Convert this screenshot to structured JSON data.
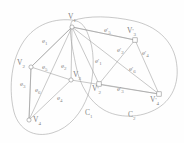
{
  "figure": {
    "type": "graph-diagram",
    "stroke_color": "#9b9b9b",
    "text_color": "#8a8a8a",
    "background": "#fefefe"
  },
  "clusters": [
    {
      "id": "C1",
      "label": "C",
      "sub": "1",
      "x": 86,
      "y": 113
    },
    {
      "id": "C2",
      "label": "C",
      "sub": "2",
      "x": 130,
      "y": 115
    }
  ],
  "nodes": [
    {
      "id": "V1",
      "label": "V",
      "sub": "1",
      "prime": "",
      "shape": "circle",
      "cx": 72,
      "cy": 27,
      "lx": 68,
      "ly": 14
    },
    {
      "id": "V2",
      "label": "V",
      "sub": "2",
      "prime": "",
      "shape": "circle",
      "cx": 31,
      "cy": 67,
      "lx": 18,
      "ly": 59
    },
    {
      "id": "V3",
      "label": "V",
      "sub": "3",
      "prime": "",
      "shape": "circle",
      "cx": 71,
      "cy": 80,
      "lx": 72,
      "ly": 70
    },
    {
      "id": "V4",
      "label": "V",
      "sub": "4",
      "prime": "",
      "shape": "circle",
      "cx": 29,
      "cy": 120,
      "lx": 33,
      "ly": 117
    },
    {
      "id": "Vp1",
      "label": "V",
      "sub": "3",
      "prime": "'",
      "shape": "square",
      "cx": 135,
      "cy": 40,
      "lx": 127,
      "ly": 28
    },
    {
      "id": "Vp2",
      "label": "V",
      "sub": "2",
      "prime": "'",
      "shape": "square",
      "cx": 99,
      "cy": 84,
      "lx": 93,
      "ly": 85
    },
    {
      "id": "Vp4",
      "label": "V",
      "sub": "4",
      "prime": "'",
      "shape": "square",
      "cx": 159,
      "cy": 94,
      "lx": 151,
      "ly": 97
    }
  ],
  "edges": [
    {
      "id": "e1",
      "from": "V1",
      "to": "V2",
      "label": "e",
      "sub": "1",
      "prime": "",
      "lx": 42,
      "ly": 40
    },
    {
      "id": "e5",
      "from": "V2",
      "to": "V1",
      "label": "e",
      "sub": "5",
      "prime": "",
      "lx": 42,
      "ly": 66
    },
    {
      "id": "e2",
      "from": "V1",
      "to": "V3",
      "label": "e",
      "sub": "2",
      "prime": "",
      "lx": 62,
      "ly": 65
    },
    {
      "id": "e3",
      "from": "V2",
      "to": "V4",
      "label": "e",
      "sub": "3",
      "prime": "",
      "lx": 21,
      "ly": 83
    },
    {
      "id": "e6",
      "from": "V2",
      "to": "V4",
      "label": "e",
      "sub": "6",
      "prime": "",
      "lx": 36,
      "ly": 88
    },
    {
      "id": "e4",
      "from": "V3",
      "to": "V4",
      "label": "e",
      "sub": "4",
      "prime": "",
      "lx": 58,
      "ly": 97
    },
    {
      "id": "ep5",
      "from": "V1",
      "to": "Vp1",
      "label": "e",
      "sub": "5",
      "prime": "'",
      "lx": 105,
      "ly": 29
    },
    {
      "id": "ep2",
      "from": "V1",
      "to": "Vp1",
      "label": "e",
      "sub": "2",
      "prime": "'",
      "lx": 118,
      "ly": 49
    },
    {
      "id": "ep4",
      "from": "Vp1",
      "to": "Vp4",
      "label": "e",
      "sub": "4",
      "prime": "'",
      "lx": 143,
      "ly": 52
    },
    {
      "id": "ep1",
      "from": "V1",
      "to": "Vp2",
      "label": "e",
      "sub": "1",
      "prime": "'",
      "lx": 96,
      "ly": 60
    },
    {
      "id": "ep6",
      "from": "V1",
      "to": "Vp4",
      "label": "e",
      "sub": "6",
      "prime": "'",
      "lx": 130,
      "ly": 68
    },
    {
      "id": "ep3",
      "from": "Vp2",
      "to": "Vp4",
      "label": "e",
      "sub": "3",
      "prime": "'",
      "lx": 118,
      "ly": 88
    }
  ]
}
